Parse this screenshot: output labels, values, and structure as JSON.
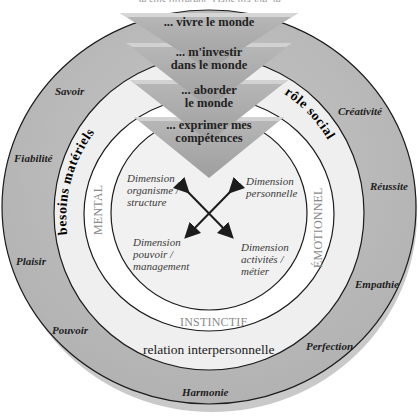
{
  "header": {
    "partial_title": "Je suis différent. Dans ma vie, je..."
  },
  "funnel": [
    {
      "text_line1": "... vivre le monde",
      "text_line2": ""
    },
    {
      "text_line1": "... m'investir",
      "text_line2": "dans le monde"
    },
    {
      "text_line1": "... aborder",
      "text_line2": "le monde"
    },
    {
      "text_line1": "... exprimer mes",
      "text_line2": "compétences"
    }
  ],
  "outer_ring": {
    "values": [
      "Savoir",
      "Fiabilité",
      "Plaisir",
      "Pouvoir",
      "Harmonie",
      "Perfection",
      "Empathie",
      "Réussite",
      "Créativité"
    ]
  },
  "middle_band": {
    "left": "besoins matériels",
    "right": "rôle social",
    "bottom": "relation interpersonnelle"
  },
  "inner_band": {
    "left": "MENTAL",
    "right": "ÉMOTIONNEL",
    "bottom": "INSTINCTIF"
  },
  "core": {
    "dimensions": [
      {
        "line1": "Dimension",
        "line2": "organisme /",
        "line3": "structure"
      },
      {
        "line1": "Dimension",
        "line2": "personnelle",
        "line3": ""
      },
      {
        "line1": "Dimension",
        "line2": "pouvoir /",
        "line3": "management"
      },
      {
        "line1": "Dimension",
        "line2": "activités /",
        "line3": "métier"
      }
    ]
  },
  "colors": {
    "outer_ring": "#b9b9b9",
    "middle_band": "#efefef",
    "inner_band": "#ffffff",
    "core": "#f2f2f2",
    "funnel": "#a9a9a9",
    "funnel_edge": "#d3d3d3",
    "stroke": "#1c1c1c"
  }
}
